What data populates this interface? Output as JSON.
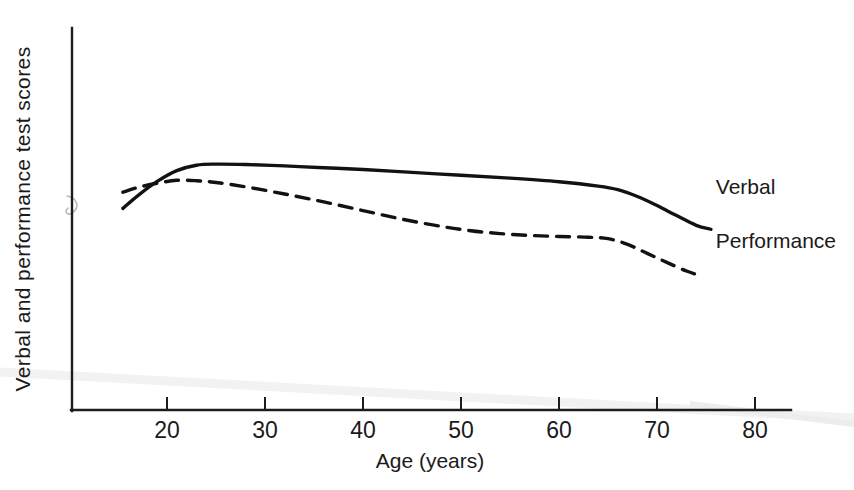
{
  "chart_data": {
    "type": "line",
    "title": "",
    "xlabel": "Age (years)",
    "ylabel": "Verbal and performance test scores",
    "xlim": [
      15,
      82
    ],
    "ylim": [
      0,
      100
    ],
    "xticks": [
      20,
      30,
      40,
      50,
      60,
      70,
      80
    ],
    "xtick_labels": [
      "20",
      "30",
      "40",
      "50",
      "60",
      "70",
      "80"
    ],
    "yticks": [],
    "ytick_labels": [],
    "grid": false,
    "legend_position": "inline-right",
    "series": [
      {
        "name": "Verbal",
        "style": "solid",
        "label_x": 76,
        "label_y": 62,
        "x": [
          15.5,
          17,
          19,
          21,
          23,
          25,
          28,
          32,
          36,
          40,
          45,
          50,
          55,
          60,
          64,
          66,
          68,
          70,
          72,
          74,
          75.5
        ],
        "y": [
          56,
          59.5,
          63.5,
          66.5,
          68,
          68.3,
          68.2,
          67.8,
          67.3,
          66.8,
          66.0,
          65.2,
          64.4,
          63.4,
          62.2,
          61.2,
          59.3,
          56.8,
          54.0,
          51.3,
          50.2
        ]
      },
      {
        "name": "Performance",
        "style": "dashed",
        "label_x": 76,
        "label_y": 47,
        "x": [
          15.5,
          17,
          19,
          21,
          23,
          25,
          28,
          32,
          36,
          40,
          44,
          48,
          51,
          54,
          57,
          60,
          63,
          65,
          67,
          69,
          71,
          73,
          74.5
        ],
        "y": [
          60.5,
          61.8,
          63.0,
          63.8,
          63.7,
          63.2,
          62.0,
          60.0,
          57.8,
          55.4,
          53.0,
          51.0,
          49.8,
          49.0,
          48.5,
          48.2,
          48.0,
          47.6,
          46.0,
          43.5,
          41.0,
          38.6,
          37.3
        ]
      }
    ]
  },
  "figure": {
    "axis_color": "#1d1d1d",
    "line_color": "#121212",
    "background": "#ffffff"
  }
}
